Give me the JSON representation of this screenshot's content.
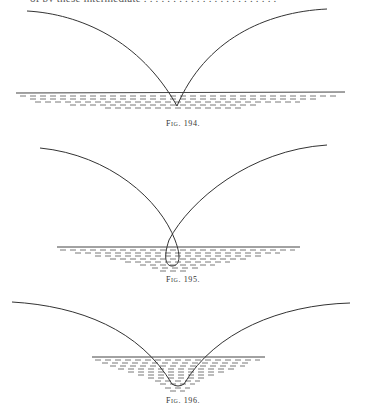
{
  "page": {
    "top_text_fragment": "of by these intermediate . . . . . . . . . . . . . . . . . . . . . . ."
  },
  "figures": [
    {
      "label": "Fig. 194.",
      "description": "Two trajectory curves meeting in a cusp just below the water surface",
      "curve_color": "#333333",
      "water_line_color": "#444444"
    },
    {
      "label": "Fig. 195.",
      "description": "Two trajectory curves crossing above the water, forming a narrow loop below the surface",
      "curve_color": "#333333",
      "water_line_color": "#444444"
    },
    {
      "label": "Fig. 196.",
      "description": "Two trajectory curves meeting in a rounded trough below a short water surface",
      "curve_color": "#333333",
      "water_line_color": "#444444"
    }
  ]
}
